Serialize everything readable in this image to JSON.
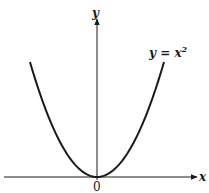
{
  "figure": {
    "y_axis_label": "y",
    "x_axis_label": "x",
    "origin_label": "0",
    "curve_label_lhs": "y = x",
    "curve_label_exp": "2",
    "colors": {
      "ink": "#1a1a1a",
      "background": "#ffffff"
    }
  },
  "chart_data": {
    "type": "line",
    "title": "",
    "xlabel": "x",
    "ylabel": "y",
    "series": [
      {
        "name": "y = x^2",
        "function": "x^2",
        "x": [
          -1.7,
          -1.2,
          -0.8,
          -0.4,
          0,
          0.4,
          0.8,
          1.2,
          1.7
        ],
        "y": [
          2.89,
          1.44,
          0.64,
          0.16,
          0,
          0.16,
          0.64,
          1.44,
          2.89
        ]
      }
    ],
    "annotations": [
      {
        "text": "y = x^2",
        "position": "upper-right near curve end"
      },
      {
        "text": "0",
        "position": "origin"
      }
    ],
    "grid": false,
    "axes": "centered at origin with arrows on +x and +y"
  }
}
